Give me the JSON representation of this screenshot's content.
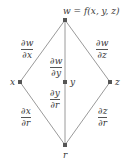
{
  "diagram": {
    "type": "tree",
    "colors": {
      "line": "#9a9a9a",
      "node": "#555555",
      "text": "#3a3a3a"
    },
    "nodes": {
      "top": {
        "id": "w",
        "label": "w = f(x, y, z)",
        "x": 65,
        "y": 20
      },
      "middle": [
        {
          "id": "x",
          "label": "x",
          "x": 20,
          "y": 82
        },
        {
          "id": "y",
          "label": "y",
          "x": 65,
          "y": 82
        },
        {
          "id": "z",
          "label": "z",
          "x": 110,
          "y": 82
        }
      ],
      "bottom": {
        "id": "r",
        "label": "r",
        "x": 65,
        "y": 145
      }
    },
    "edges": [
      {
        "from": "w",
        "to": "x",
        "num": "∂w",
        "den": "∂x"
      },
      {
        "from": "w",
        "to": "y",
        "num": "∂w",
        "den": "∂y"
      },
      {
        "from": "w",
        "to": "z",
        "num": "∂w",
        "den": "∂z"
      },
      {
        "from": "x",
        "to": "r",
        "num": "∂x",
        "den": "∂r"
      },
      {
        "from": "y",
        "to": "r",
        "num": "∂y",
        "den": "∂r"
      },
      {
        "from": "z",
        "to": "r",
        "num": "∂z",
        "den": "∂r"
      }
    ]
  }
}
